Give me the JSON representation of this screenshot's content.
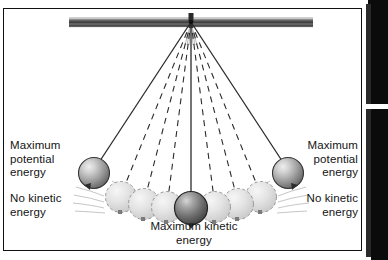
{
  "figure": {
    "type": "physics-diagram",
    "background_color": "#ffffff",
    "border_color": "#111111",
    "frame": {
      "x": 3,
      "y": 8,
      "width": 359,
      "height": 243
    }
  },
  "labels": {
    "left_potential": "Maximum\npotential\nenergy",
    "left_kinetic": "No kinetic\nenergy",
    "right_potential": "Maximum\npotential\nenergy",
    "right_kinetic": "No kinetic\nenergy",
    "bottom_kinetic": "Maximum kinetic\nenergy"
  },
  "diagram": {
    "pivot": {
      "x": 187,
      "y": 12
    },
    "support_bar": {
      "x": 65,
      "y": 8,
      "width": 244,
      "height": 9,
      "color_dark": "#3a3a3a",
      "color_light": "#f2f2f2"
    },
    "strings": {
      "solid_count": 3,
      "dashed_count": 6,
      "color": "#2b2b2b",
      "dash_pattern": "6,5"
    },
    "bobs": [
      {
        "name": "bob-left-extreme",
        "cx": 90,
        "cy": 164,
        "r": 15.5,
        "style": "solid",
        "fill_dark": "#6b6b6b",
        "fill_light": "#d8d8d8"
      },
      {
        "name": "bob-ghost-left-3",
        "cx": 117,
        "cy": 188,
        "r": 15.5,
        "style": "ghost",
        "fill": "#e2e2e2"
      },
      {
        "name": "bob-ghost-left-2",
        "cx": 140,
        "cy": 195,
        "r": 15.5,
        "style": "ghost",
        "fill": "#dcdcdc"
      },
      {
        "name": "bob-ghost-left-1",
        "cx": 163,
        "cy": 198,
        "r": 15.5,
        "style": "ghost",
        "fill": "#d9d9d9"
      },
      {
        "name": "bob-center-lowest",
        "cx": 187,
        "cy": 199,
        "r": 16.5,
        "style": "solid-dark",
        "fill_dark": "#4f4f4f",
        "fill_light": "#c2c2c2"
      },
      {
        "name": "bob-ghost-right-1",
        "cx": 211,
        "cy": 198,
        "r": 15.5,
        "style": "ghost",
        "fill": "#d9d9d9"
      },
      {
        "name": "bob-ghost-right-2",
        "cx": 234,
        "cy": 195,
        "r": 15.5,
        "style": "ghost",
        "fill": "#dcdcdc"
      },
      {
        "name": "bob-ghost-right-3",
        "cx": 257,
        "cy": 188,
        "r": 15.5,
        "style": "ghost",
        "fill": "#e2e2e2"
      },
      {
        "name": "bob-right-extreme",
        "cx": 284,
        "cy": 164,
        "r": 15.5,
        "style": "solid",
        "fill_dark": "#6b6b6b",
        "fill_light": "#d8d8d8"
      }
    ],
    "motion_streaks": {
      "present": true,
      "color": "#bfbfbf"
    }
  }
}
